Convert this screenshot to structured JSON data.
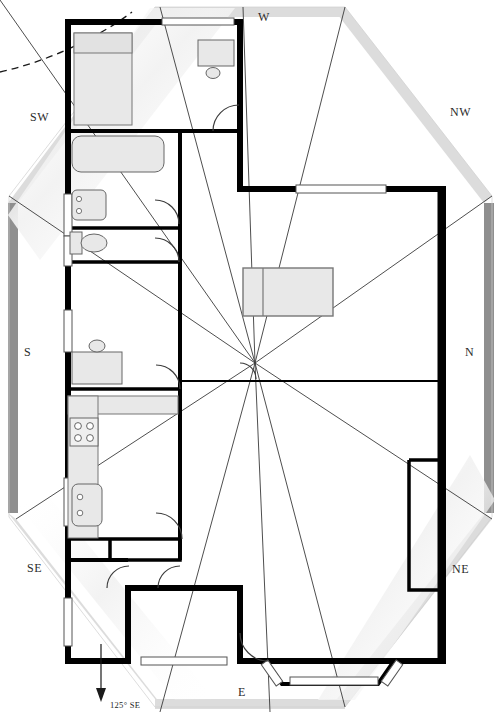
{
  "figure": {
    "kind": "architectural-floor-plan",
    "width": 501,
    "height": 724,
    "background_color": "#ffffff",
    "wall_color": "#000000",
    "furniture_fill": "#e8e8e8",
    "furniture_stroke": "#555555",
    "ray_color": "#3a3a3a",
    "octagon_light_color": "#dcdcdc",
    "octagon_dark_color": "#8f8f8f"
  },
  "compass": {
    "labels": [
      {
        "id": "w",
        "text": "W",
        "x": 258,
        "y": 17,
        "name": "compass-label-w"
      },
      {
        "id": "nw",
        "text": "NW",
        "x": 450,
        "y": 112,
        "name": "compass-label-nw"
      },
      {
        "id": "n",
        "text": "N",
        "x": 465,
        "y": 352,
        "name": "compass-label-n"
      },
      {
        "id": "ne",
        "text": "NE",
        "x": 452,
        "y": 569,
        "name": "compass-label-ne"
      },
      {
        "id": "e",
        "text": "E",
        "x": 238,
        "y": 692,
        "name": "compass-label-e"
      },
      {
        "id": "se",
        "text": "SE",
        "x": 27,
        "y": 568,
        "name": "compass-label-se"
      },
      {
        "id": "s",
        "text": "S",
        "x": 24,
        "y": 352,
        "name": "compass-label-s"
      },
      {
        "id": "sw",
        "text": "SW",
        "x": 30,
        "y": 117,
        "name": "compass-label-sw"
      }
    ],
    "center": {
      "x": 255,
      "y": 363
    }
  },
  "bearing_annotation": {
    "text": "125° SE",
    "x": 110,
    "y": 706,
    "arrow": {
      "x": 101,
      "y1": 648,
      "y2": 700
    }
  },
  "rooms": [
    {
      "name": "bedroom",
      "label": ""
    },
    {
      "name": "bathroom",
      "label": ""
    },
    {
      "name": "kitchen",
      "label": ""
    },
    {
      "name": "living-room",
      "label": ""
    },
    {
      "name": "hall",
      "label": ""
    }
  ],
  "fixtures": [
    {
      "name": "bed",
      "type": "bed"
    },
    {
      "name": "desk",
      "type": "desk"
    },
    {
      "name": "chair",
      "type": "chair"
    },
    {
      "name": "bathtub",
      "type": "bathtub"
    },
    {
      "name": "bathroom-sink-upper",
      "type": "sink"
    },
    {
      "name": "toilet",
      "type": "toilet"
    },
    {
      "name": "kitchen-stove",
      "type": "stove"
    },
    {
      "name": "kitchen-sink",
      "type": "sink"
    },
    {
      "name": "counter-run",
      "type": "counter"
    },
    {
      "name": "sofa",
      "type": "sofa"
    }
  ],
  "openings": [
    {
      "name": "window-top",
      "type": "window"
    },
    {
      "name": "window-nw",
      "type": "window"
    },
    {
      "name": "window-west-upper",
      "type": "window"
    },
    {
      "name": "window-west-lower",
      "type": "window"
    },
    {
      "name": "window-southwest",
      "type": "window"
    },
    {
      "name": "bay-window-bottom",
      "type": "bay-window"
    },
    {
      "name": "door-bedroom",
      "type": "door-swing"
    },
    {
      "name": "door-bath-upper",
      "type": "door-swing"
    },
    {
      "name": "door-bath-lower",
      "type": "door-swing"
    },
    {
      "name": "door-kitchen",
      "type": "door-swing"
    },
    {
      "name": "door-hall-left",
      "type": "door-swing"
    },
    {
      "name": "door-hall-right",
      "type": "door-swing"
    },
    {
      "name": "door-living",
      "type": "door-swing"
    },
    {
      "name": "door-entry",
      "type": "door-swing"
    }
  ]
}
